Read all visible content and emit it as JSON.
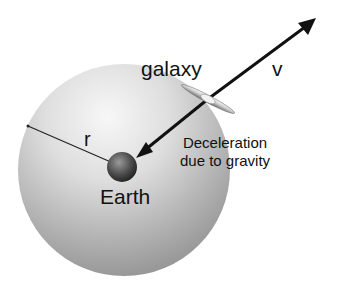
{
  "diagram": {
    "labels": {
      "galaxy": "galaxy",
      "velocity": "v",
      "radius": "r",
      "earth": "Earth",
      "deceleration_line1": "Deceleration",
      "deceleration_line2": "due to gravity"
    },
    "elements": {
      "sphere": {
        "cx": 124,
        "cy": 170,
        "r": 106
      },
      "earth": {
        "cx": 122,
        "cy": 167,
        "r": 15
      },
      "galaxy": {
        "cx": 208,
        "cy": 99
      },
      "velocity_arrow": {
        "from": [
          208,
          99
        ],
        "to": [
          315,
          19
        ]
      },
      "gravity_arrow": {
        "from": [
          208,
          99
        ],
        "to": [
          137,
          157
        ]
      },
      "radius_line": {
        "from": [
          28,
          126
        ],
        "to": [
          120,
          166
        ]
      }
    }
  }
}
